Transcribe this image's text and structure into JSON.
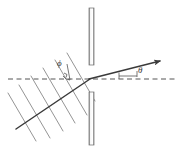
{
  "figure": {
    "background_color": "#ffffff",
    "stroke_color": "#5a5a5a",
    "dark_stroke_color": "#3a3a3a",
    "barrier_fill": "#f2f2f2",
    "labels": {
      "phi": "ϕ",
      "theta": "θ"
    }
  },
  "diagram_data": {
    "type": "schematic",
    "width": 180,
    "height": 150,
    "slit_vertex": {
      "x": 89,
      "y": 79
    },
    "optical_axis": {
      "name": "horizontal-dashed-axis",
      "style": "dashed",
      "x1": 8,
      "y1": 79,
      "x2": 176,
      "y2": 79
    },
    "incident_ray": {
      "name": "incident-ray",
      "x1": 16,
      "y1": 129,
      "x2": 89,
      "y2": 79,
      "arrow": false
    },
    "diffracted_ray": {
      "name": "diffracted-ray-arrow",
      "x1": 89,
      "y1": 79,
      "x2": 164,
      "y2": 60,
      "arrow": true
    },
    "wavefronts": {
      "name": "plane-wavefronts",
      "count": 6,
      "angle_deg": 60,
      "lines": [
        {
          "x1": 8,
          "y1": 93,
          "x2": 36,
          "y2": 141
        },
        {
          "x1": 19,
          "y1": 85,
          "x2": 50,
          "y2": 138
        },
        {
          "x1": 31,
          "y1": 76,
          "x2": 63,
          "y2": 131
        },
        {
          "x1": 43,
          "y1": 68,
          "x2": 75,
          "y2": 123
        },
        {
          "x1": 55,
          "y1": 60,
          "x2": 87,
          "y2": 115
        },
        {
          "x1": 67,
          "y1": 53,
          "x2": 95,
          "y2": 101
        }
      ]
    },
    "barriers": [
      {
        "name": "upper-barrier",
        "x": 89,
        "y": 8,
        "width": 5,
        "height": 57
      },
      {
        "name": "lower-barrier",
        "x": 89,
        "y": 92,
        "width": 5,
        "height": 53
      }
    ],
    "angle_markers": [
      {
        "name": "phi-angle-marker",
        "label": "ϕ",
        "vertex": {
          "x": 70,
          "y": 79
        },
        "reference": "normal-to-wavefront",
        "label_pos": {
          "x": 57,
          "y": 59
        }
      },
      {
        "name": "theta-angle-marker",
        "label": "θ",
        "vertex": {
          "x": 89,
          "y": 79
        },
        "reference": "optical-axis",
        "label_pos": {
          "x": 138,
          "y": 66
        }
      }
    ]
  }
}
